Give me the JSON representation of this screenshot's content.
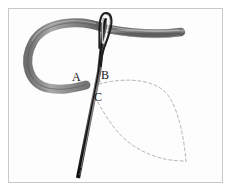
{
  "figure": {
    "background_color": "#fdfdfd",
    "frame_color": "#c9c9c9",
    "labels": [
      {
        "id": "A",
        "text": "A",
        "x": 76,
        "y": 77,
        "meaning": "thread exit point at left of loop"
      },
      {
        "id": "B",
        "text": "B",
        "x": 105,
        "y": 75,
        "meaning": "needle entry point right of A"
      },
      {
        "id": "C",
        "text": "C",
        "x": 98,
        "y": 97,
        "meaning": "needle re-emergence point below A"
      }
    ],
    "elements": {
      "needle": {
        "name": "sewing-needle",
        "color_dark": "#1b1b1b",
        "color_mid": "#5a5a5a",
        "eye_top_y": 13,
        "point_y": 178,
        "tilt": "top-right to bottom-left"
      },
      "thread": {
        "name": "embroidery-thread-loop",
        "color": "#8e8e8e",
        "color_shade": "#6b6b6b",
        "shape": "open loop curving left from needle eye, returning to point A",
        "tail_end_x": 181,
        "tail_end_y": 32
      },
      "guide": {
        "name": "dashed-petal-guideline",
        "color": "#b0b0b0",
        "style": "dashed",
        "shape": "leaf/petal outline from B and C meeting at right tip",
        "tip_x": 186,
        "tip_y": 161
      }
    }
  }
}
